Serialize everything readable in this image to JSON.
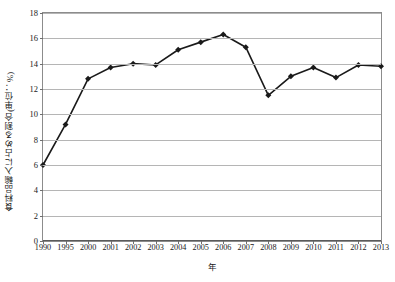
{
  "chart_data": {
    "type": "line",
    "title": "",
    "subtitle": "",
    "xlabel": "年",
    "ylabel": "食料品輸入に占める割合(単位：%)",
    "categories": [
      "1990",
      "1995",
      "2000",
      "2001",
      "2002",
      "2003",
      "2004",
      "2005",
      "2006",
      "2007",
      "2008",
      "2009",
      "2010",
      "2011",
      "2012",
      "2013"
    ],
    "values": [
      6.0,
      9.2,
      12.8,
      13.7,
      14.0,
      13.9,
      15.1,
      15.7,
      16.3,
      15.3,
      11.5,
      13.0,
      13.7,
      12.9,
      13.9,
      13.8
    ],
    "series": [
      {
        "name": "食料品輸入に占める割合",
        "values": [
          6.0,
          9.2,
          12.8,
          13.7,
          14.0,
          13.9,
          15.1,
          15.7,
          16.3,
          15.3,
          11.5,
          13.0,
          13.7,
          12.9,
          13.9,
          13.8
        ]
      }
    ],
    "ylim": [
      0,
      18
    ],
    "ytick_labels": [
      "0",
      "2",
      "4",
      "6",
      "8",
      "10",
      "12",
      "14",
      "16",
      "18"
    ],
    "ytick_values": [
      0,
      2,
      4,
      6,
      8,
      10,
      12,
      14,
      16,
      18
    ],
    "ytick_step": 2,
    "grid": true,
    "grid_axis": "y",
    "legend": false,
    "legend_position": "none",
    "marker": "diamond",
    "line_color": "#1a1a1a",
    "marker_color": "#1a1a1a",
    "grid_color": "#b5b5b5",
    "plot_border_color": "#8c8c8c",
    "background_color": "#ffffff",
    "annotations": []
  }
}
